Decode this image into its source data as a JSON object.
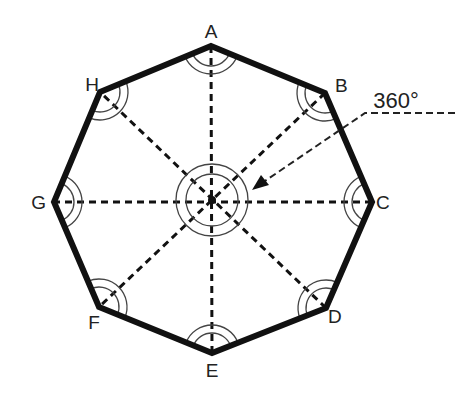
{
  "diagram": {
    "center": {
      "x": 212,
      "y": 200
    },
    "vertices": [
      {
        "label": "A",
        "x": 211,
        "y": 46,
        "lx": 211,
        "ly": 38,
        "anchor": "middle"
      },
      {
        "label": "B",
        "x": 325,
        "y": 93,
        "lx": 335,
        "ly": 92,
        "anchor": "start"
      },
      {
        "label": "C",
        "x": 372,
        "y": 202,
        "lx": 376,
        "ly": 209,
        "anchor": "start"
      },
      {
        "label": "D",
        "x": 326,
        "y": 308,
        "lx": 328,
        "ly": 323,
        "anchor": "start"
      },
      {
        "label": "E",
        "x": 212,
        "y": 353,
        "lx": 212,
        "ly": 377,
        "anchor": "middle"
      },
      {
        "label": "F",
        "x": 99,
        "y": 307,
        "lx": 94,
        "ly": 329,
        "anchor": "middle"
      },
      {
        "label": "G",
        "x": 54,
        "y": 202,
        "lx": 46,
        "ly": 209,
        "anchor": "end"
      },
      {
        "label": "H",
        "x": 100,
        "y": 92,
        "lx": 92,
        "ly": 91,
        "anchor": "middle"
      }
    ],
    "annotation": {
      "text": "360°",
      "x": 396,
      "y": 108
    },
    "colors": {
      "stroke": "#111111",
      "thin": "#444444",
      "background": "#ffffff"
    }
  }
}
